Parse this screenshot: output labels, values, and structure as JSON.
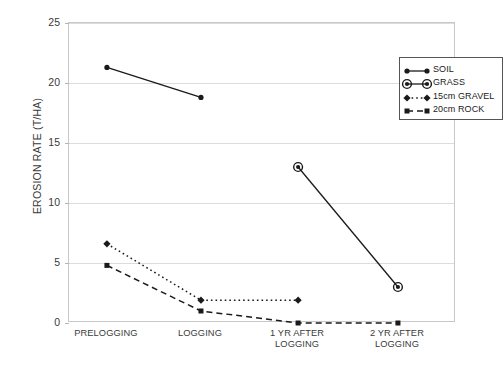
{
  "chart_data": {
    "type": "line",
    "title": "",
    "xlabel": "",
    "ylabel": "EROSION RATE (T/HA)",
    "categories": [
      "PRELOGGING",
      "LOGGING",
      "1 YR AFTER\nLOGGING",
      "2 YR AFTER\nLOGGING"
    ],
    "category_labels_flat": [
      "PRELOGGING",
      "LOGGING",
      "1 YR AFTER LOGGING",
      "2 YR AFTER LOGGING"
    ],
    "ylim": [
      0,
      25
    ],
    "yticks": [
      0,
      5,
      10,
      15,
      20,
      25
    ],
    "ytick_labels": [
      "0",
      "5",
      "10",
      "15",
      "20",
      "25"
    ],
    "grid": true,
    "grid_axis": "y",
    "legend_position": "upper-right-inside",
    "series": [
      {
        "name": "SOIL",
        "line_style": "solid",
        "marker": "circle",
        "color": "#1a1a1a",
        "x": [
          "PRELOGGING",
          "LOGGING"
        ],
        "values": [
          21.3,
          18.8
        ]
      },
      {
        "name": "GRASS",
        "line_style": "solid",
        "marker": "circle-dot",
        "color": "#1a1a1a",
        "x": [
          "1 YR AFTER LOGGING",
          "2 YR AFTER LOGGING"
        ],
        "values": [
          13.0,
          3.0
        ]
      },
      {
        "name": "15cm  GRAVEL",
        "line_style": "dotted",
        "marker": "diamond",
        "color": "#1a1a1a",
        "x": [
          "PRELOGGING",
          "LOGGING",
          "1 YR AFTER LOGGING"
        ],
        "values": [
          6.6,
          1.9,
          1.9
        ]
      },
      {
        "name": "20cm  ROCK",
        "line_style": "dashed",
        "marker": "square",
        "color": "#1a1a1a",
        "x": [
          "PRELOGGING",
          "LOGGING",
          "1 YR AFTER LOGGING",
          "2 YR AFTER LOGGING"
        ],
        "values": [
          4.8,
          1.0,
          0.0,
          0.0
        ]
      }
    ]
  },
  "axis": {
    "ylabel": "EROSION RATE (T/HA)",
    "yticks": [
      "25",
      "20",
      "15",
      "10",
      "5",
      "0"
    ],
    "xticks": [
      "PRELOGGING",
      "LOGGING",
      "1 YR AFTER\nLOGGING",
      "2 YR AFTER\nLOGGING"
    ]
  },
  "legend": {
    "items": [
      {
        "label": "SOIL"
      },
      {
        "label": "GRASS"
      },
      {
        "label": "15cm  GRAVEL"
      },
      {
        "label": "20cm  ROCK"
      }
    ]
  }
}
